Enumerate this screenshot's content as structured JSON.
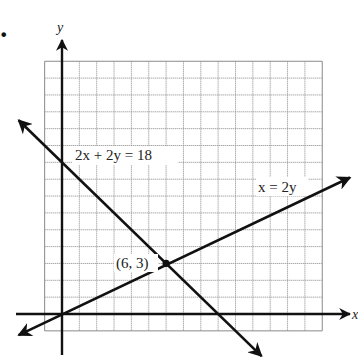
{
  "figure": {
    "bullet": "•",
    "x_axis_label": "x",
    "y_axis_label": "y"
  },
  "chart_data": {
    "type": "line",
    "title": "",
    "xlabel": "x",
    "ylabel": "y",
    "grid": true,
    "xlim": [
      -1,
      15
    ],
    "ylim": [
      -1,
      15
    ],
    "series": [
      {
        "name": "2x + 2y = 18",
        "equation": "2x + 2y = 18",
        "points": [
          [
            -2.5,
            11.5
          ],
          [
            0,
            9
          ],
          [
            9,
            0
          ],
          [
            11.5,
            -2.5
          ]
        ],
        "x_intercept": 9,
        "y_intercept": 9
      },
      {
        "name": "x = 2y",
        "equation": "x = 2y",
        "points": [
          [
            -2.5,
            -1.25
          ],
          [
            0,
            0
          ],
          [
            6,
            3
          ],
          [
            16.6,
            8.1
          ]
        ],
        "x_intercept": 0,
        "y_intercept": 0
      }
    ],
    "annotations": [
      {
        "text": "(6, 3)",
        "x": 6,
        "y": 3,
        "type": "intersection-point"
      },
      {
        "text": "2x + 2y = 18",
        "near_series": "2x + 2y = 18"
      },
      {
        "text": "x = 2y",
        "near_series": "x = 2y"
      }
    ]
  },
  "labels": {
    "line1": "2x + 2y = 18",
    "line2": "x = 2y",
    "intersection": "(6, 3)"
  }
}
